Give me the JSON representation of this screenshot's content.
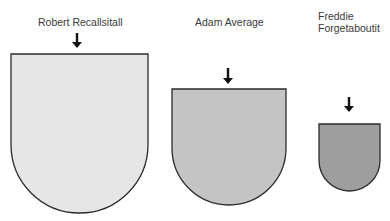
{
  "figures": [
    {
      "name": "Robert Recallsitall",
      "label_lines": [
        "Robert Recallsitall"
      ],
      "size_rank": "large",
      "fill": "#e6e6e6",
      "shape": {
        "x": 11,
        "y": 54,
        "w": 137,
        "h": 159
      },
      "arrow": {
        "cx": 77,
        "top": 33,
        "bottom": 48
      }
    },
    {
      "name": "Adam Average",
      "label_lines": [
        "Adam Average"
      ],
      "size_rank": "medium",
      "fill": "#c4c4c4",
      "shape": {
        "x": 172,
        "y": 89,
        "w": 114,
        "h": 116
      },
      "arrow": {
        "cx": 228,
        "top": 68,
        "bottom": 84
      }
    },
    {
      "name": "Freddie Forgetaboutit",
      "label_lines": [
        "Freddie",
        "Forgetaboutit"
      ],
      "size_rank": "small",
      "fill": "#9e9e9e",
      "shape": {
        "x": 319,
        "y": 124,
        "w": 61,
        "h": 67
      },
      "arrow": {
        "cx": 349,
        "top": 97,
        "bottom": 112
      }
    }
  ],
  "colors": {
    "outline": "#2b2b2b",
    "arrow": "#111111",
    "text": "#3a3a3a"
  }
}
